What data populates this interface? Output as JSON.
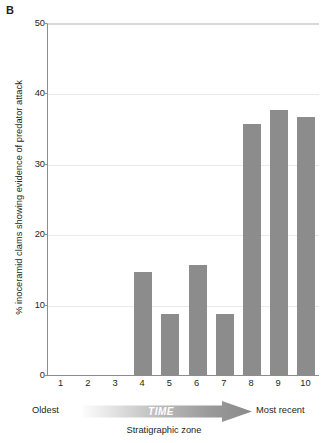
{
  "panel": {
    "label": "B"
  },
  "chart_data": {
    "type": "bar",
    "title": "",
    "xlabel": "Stratigraphic zone",
    "ylabel": "% inoceramid clams showing evidence of predator attack",
    "categories": [
      "1",
      "2",
      "3",
      "4",
      "5",
      "6",
      "7",
      "8",
      "9",
      "10"
    ],
    "values": [
      0,
      0,
      0,
      14.6,
      8.7,
      15.6,
      8.7,
      35.7,
      37.6,
      36.6
    ],
    "ylim": [
      0,
      50
    ],
    "yticks": [
      0,
      10,
      20,
      30,
      40,
      50
    ],
    "ytick_labels": [
      "0",
      "10",
      "20",
      "30",
      "40",
      "50"
    ],
    "grid": true,
    "legend": "none",
    "bar_color": "#8c8c8c",
    "annotations": {
      "axis_direction_label": "TIME",
      "axis_start_label": "Oldest",
      "axis_end_label": "Most recent"
    }
  },
  "axis_annotation": {
    "oldest": "Oldest",
    "most_recent": "Most recent",
    "time": "TIME",
    "caption": "Stratigraphic zone"
  },
  "colors": {
    "bar": "#8c8c8c",
    "gridline": "#e9e9e9",
    "axis": "#8d8d8d",
    "arrow_start": "#f2f2f2",
    "arrow_end": "#8c8c8c",
    "text": "#231f20"
  }
}
